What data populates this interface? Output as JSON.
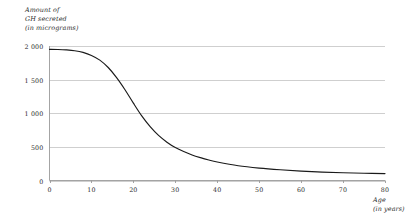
{
  "chart_data": {
    "type": "line",
    "title": "",
    "ylabel": "Amount of GH secreted (in micrograms)",
    "ylabel_lines": [
      "Amount of",
      "GH secreted",
      "(in micrograms)"
    ],
    "xlabel": "Age (in years)",
    "xlabel_lines": [
      "Age",
      "(in years)"
    ],
    "xlim": [
      0,
      80
    ],
    "ylim": [
      0,
      2000
    ],
    "grid": "horizontal",
    "legend": "none",
    "x_ticks": [
      0,
      10,
      20,
      30,
      40,
      50,
      60,
      70,
      80
    ],
    "x_tick_labels": [
      "0",
      "10",
      "20",
      "30",
      "40",
      "50",
      "60",
      "70",
      "80"
    ],
    "y_ticks": [
      0,
      500,
      1000,
      1500,
      2000
    ],
    "y_tick_labels": [
      "0",
      "500",
      "1 000",
      "1 500",
      "2 000"
    ],
    "series": [
      {
        "name": "GH secretion",
        "color": "#1a1a1a",
        "x": [
          0,
          2,
          4,
          6,
          8,
          10,
          12,
          14,
          16,
          18,
          20,
          22,
          24,
          26,
          28,
          30,
          32,
          34,
          36,
          38,
          40,
          45,
          50,
          55,
          60,
          65,
          70,
          75,
          80
        ],
        "values": [
          1950,
          1948,
          1942,
          1930,
          1905,
          1860,
          1790,
          1680,
          1530,
          1350,
          1150,
          960,
          800,
          670,
          570,
          490,
          430,
          380,
          340,
          305,
          275,
          220,
          185,
          160,
          140,
          125,
          115,
          108,
          103
        ]
      }
    ]
  },
  "colors": {
    "curve": "#1a1a1a",
    "gridline": "#c9c9c9",
    "axis": "#9a9a9a",
    "background": "#ffffff",
    "text": "#2b2b2b"
  }
}
